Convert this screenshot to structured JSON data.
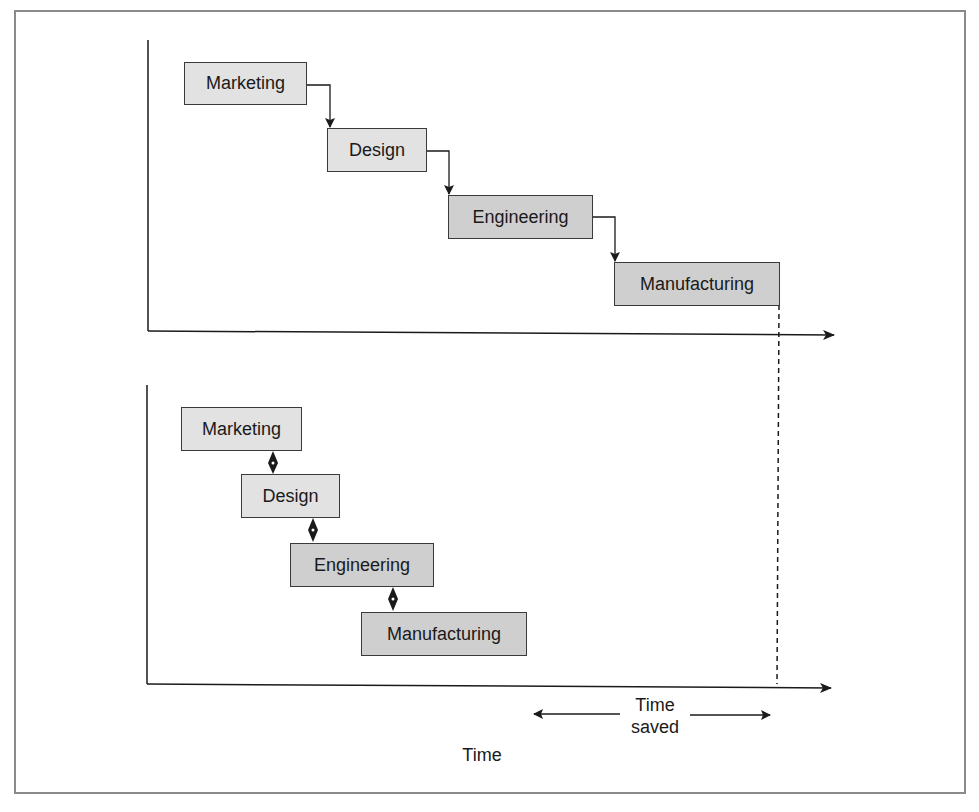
{
  "diagram": {
    "sequential": {
      "stages": [
        {
          "label": "Marketing",
          "shade": "light"
        },
        {
          "label": "Design",
          "shade": "light"
        },
        {
          "label": "Engineering",
          "shade": "dark"
        },
        {
          "label": "Manufacturing",
          "shade": "dark"
        }
      ],
      "connector": "single-arrow"
    },
    "concurrent": {
      "stages": [
        {
          "label": "Marketing",
          "shade": "light"
        },
        {
          "label": "Design",
          "shade": "light"
        },
        {
          "label": "Engineering",
          "shade": "dark"
        },
        {
          "label": "Manufacturing",
          "shade": "dark"
        }
      ],
      "connector": "double-arrow"
    },
    "time_saved_label_line1": "Time",
    "time_saved_label_line2": "saved",
    "x_axis_label": "Time"
  },
  "colors": {
    "light_box": "#e2e2e2",
    "dark_box": "#cfcfcf",
    "line": "#1a1a1a",
    "frame": "#8a8a8a"
  }
}
